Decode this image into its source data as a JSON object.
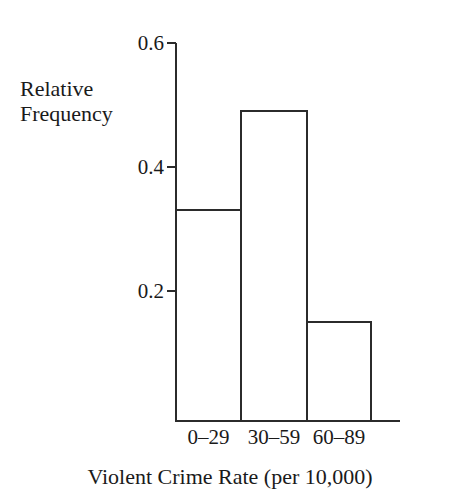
{
  "chart_data": {
    "type": "bar",
    "title": "",
    "subtitle": "",
    "xlabel": "Violent Crime Rate (per 10,000)",
    "ylabel_lines": [
      "Relative",
      "Frequency"
    ],
    "ylabel": "Relative Frequency",
    "categories": [
      "0–29",
      "30–59",
      "60–89"
    ],
    "values": [
      0.34,
      0.5,
      0.16
    ],
    "yticks": [
      0.2,
      0.4,
      0.6
    ],
    "ytick_labels": [
      "0.2",
      "0.4",
      "0.6"
    ],
    "ylim": [
      0,
      0.6
    ],
    "grid": false,
    "legend": false,
    "legend_position": "none",
    "bar_fill_color": "#ffffff",
    "bar_edge_color": "#2b2b2b",
    "axis_color": "#2b2b2b",
    "background_color": "#ffffff",
    "annotations": []
  },
  "geometry": {
    "baseline_y": 421,
    "axis_top_y": 43,
    "axis_x": 176,
    "axis_right_x": 400,
    "pixels_per_unit": 620,
    "bars": [
      {
        "x": 176,
        "width": 65
      },
      {
        "x": 241,
        "width": 66
      },
      {
        "x": 307,
        "width": 64
      }
    ],
    "ytick_y": {
      "0.6": 43,
      "0.4": 167,
      "0.2": 291
    },
    "ytick_label_right_x": 164,
    "xcat_label_y": 427
  }
}
